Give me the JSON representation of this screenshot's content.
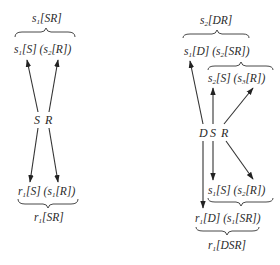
{
  "left_diagram": {
    "top_label": {
      "base": "s",
      "sub": "1",
      "bracket": "[SR]"
    },
    "upper_parts": {
      "a_base": "s",
      "a_sub": "1",
      "a_bracket": "[S]",
      "b_base": "s",
      "b_sub": "2",
      "b_bracket": "[R]"
    },
    "nodes": {
      "s": "S",
      "r": "R"
    },
    "lower_parts": {
      "a_base": "r",
      "a_sub": "1",
      "a_bracket": "[S]",
      "b_base": "s",
      "b_sub": "1",
      "b_bracket": "[R]"
    },
    "bottom_label": {
      "base": "r",
      "sub": "1",
      "bracket": "[SR]"
    }
  },
  "right_diagram": {
    "top_label": {
      "base": "s",
      "sub": "2",
      "bracket": "[DR]"
    },
    "upper_parts": {
      "a_base": "s",
      "a_sub": "1",
      "a_bracket": "[D]",
      "b_base": "s",
      "b_sub": "2",
      "b_bracket": "[SR]"
    },
    "mid_upper_parts": {
      "a_base": "s",
      "a_sub": "2",
      "a_bracket": "[S]",
      "b_base": "s",
      "b_sub": "3",
      "b_bracket": "[R]"
    },
    "nodes": {
      "d": "D",
      "s": "S",
      "r": "R"
    },
    "mid_lower_parts": {
      "a_base": "s",
      "a_sub": "1",
      "a_bracket": "[S]",
      "b_base": "s",
      "b_sub": "2",
      "b_bracket": "[R]"
    },
    "lower_parts": {
      "a_base": "r",
      "a_sub": "1",
      "a_bracket": "[D]",
      "b_base": "s",
      "b_sub": "1",
      "b_bracket": "[SR]"
    },
    "bottom_label": {
      "base": "r",
      "sub": "1",
      "bracket": "[DSR]"
    }
  }
}
